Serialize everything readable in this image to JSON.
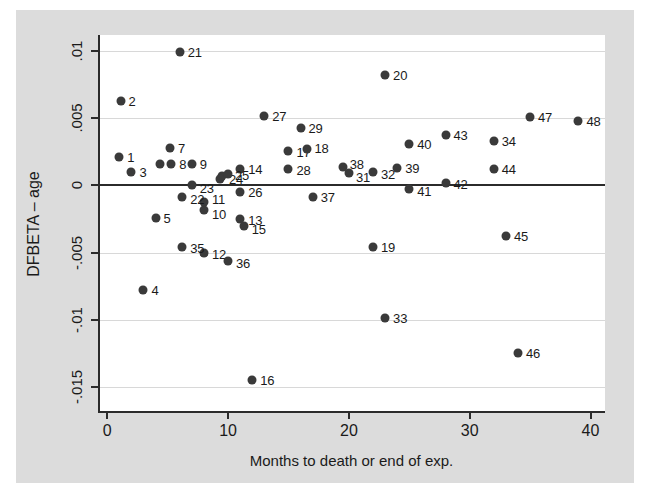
{
  "figure": {
    "background_color": "#dcdcdc",
    "plot_background_color": "#ffffff",
    "marker_color": "#3a3a3a",
    "axis_color": "#2b2b2b",
    "gridline_color": "#d8d8d8"
  },
  "chart_data": {
    "type": "scatter",
    "title": "",
    "xlabel": "Months to death or end of exp.",
    "ylabel": "DFBETA – age",
    "xlim": [
      -0.6,
      41.2
    ],
    "ylim": [
      -0.0168,
      0.0112
    ],
    "xticks": [
      0,
      10,
      20,
      30,
      40
    ],
    "xtick_labels": [
      "0",
      "10",
      "20",
      "30",
      "40"
    ],
    "yticks": [
      0.01,
      0.005,
      0,
      -0.005,
      -0.01,
      -0.015
    ],
    "ytick_labels": [
      ".01",
      ".005",
      "0",
      "-.005",
      "-.01",
      "-.015"
    ],
    "grid": true,
    "grid_axis": "y",
    "zero_reference_line": 0,
    "legend": null,
    "point_labels": true,
    "points": [
      {
        "label": "1",
        "x": 1.0,
        "y": 0.00215,
        "lx": 8,
        "ly": 0
      },
      {
        "label": "2",
        "x": 1.1,
        "y": 0.0063,
        "lx": 8,
        "ly": 0
      },
      {
        "label": "3",
        "x": 2.0,
        "y": 0.001,
        "lx": 8,
        "ly": 0
      },
      {
        "label": "4",
        "x": 3.0,
        "y": -0.0078,
        "lx": 8,
        "ly": 0
      },
      {
        "label": "5",
        "x": 4.0,
        "y": -0.0024,
        "lx": 8,
        "ly": 0
      },
      {
        "label": "6",
        "x": 4.4,
        "y": 0.0016,
        "lx": 8,
        "ly": 0,
        "hide_label": true
      },
      {
        "label": "7",
        "x": 5.2,
        "y": 0.00275,
        "lx": 8,
        "ly": 0
      },
      {
        "label": "8",
        "x": 5.3,
        "y": 0.0016,
        "lx": 8,
        "ly": 0
      },
      {
        "label": "9",
        "x": 7.0,
        "y": 0.0016,
        "lx": 8,
        "ly": 0
      },
      {
        "label": "10",
        "x": 8.0,
        "y": -0.00185,
        "lx": 8,
        "ly": 4
      },
      {
        "label": "11",
        "x": 8.0,
        "y": -0.00125,
        "lx": 8,
        "ly": -3
      },
      {
        "label": "12",
        "x": 8.0,
        "y": -0.005,
        "lx": 8,
        "ly": 1
      },
      {
        "label": "13",
        "x": 11.0,
        "y": -0.0025,
        "lx": 8,
        "ly": 1
      },
      {
        "label": "14",
        "x": 11.0,
        "y": 0.00125,
        "lx": 8,
        "ly": 0
      },
      {
        "label": "15",
        "x": 11.3,
        "y": -0.00305,
        "lx": 8,
        "ly": 3
      },
      {
        "label": "16",
        "x": 12.0,
        "y": -0.0145,
        "lx": 8,
        "ly": 0
      },
      {
        "label": "17",
        "x": 15.0,
        "y": 0.00255,
        "lx": 8,
        "ly": 1
      },
      {
        "label": "18",
        "x": 16.5,
        "y": 0.00268,
        "lx": 8,
        "ly": -1
      },
      {
        "label": "19",
        "x": 22.0,
        "y": -0.0046,
        "lx": 8,
        "ly": 0
      },
      {
        "label": "20",
        "x": 23.0,
        "y": 0.00825,
        "lx": 8,
        "ly": 0
      },
      {
        "label": "21",
        "x": 6.0,
        "y": 0.00995,
        "lx": 8,
        "ly": 0
      },
      {
        "label": "22",
        "x": 6.2,
        "y": -0.00085,
        "lx": 8,
        "ly": 2
      },
      {
        "label": "23",
        "x": 7.0,
        "y": 3e-05,
        "lx": 8,
        "ly": 3
      },
      {
        "label": "24",
        "x": 9.5,
        "y": 0.00068,
        "lx": 7,
        "ly": 3
      },
      {
        "label": "25",
        "x": 10.0,
        "y": 0.00085,
        "lx": 7,
        "ly": 1
      },
      {
        "label": "26",
        "x": 11.0,
        "y": -0.00048,
        "lx": 8,
        "ly": 0
      },
      {
        "label": "27",
        "x": 13.0,
        "y": 0.00515,
        "lx": 8,
        "ly": 0
      },
      {
        "label": "28",
        "x": 15.0,
        "y": 0.00125,
        "lx": 8,
        "ly": 1
      },
      {
        "label": "29",
        "x": 16.0,
        "y": 0.00425,
        "lx": 8,
        "ly": 0
      },
      {
        "label": "30",
        "x": 9.3,
        "y": 0.00045,
        "lx": 8,
        "ly": 0,
        "hide_label": true
      },
      {
        "label": "31",
        "x": 20.0,
        "y": 0.00095,
        "lx": 7,
        "ly": 4
      },
      {
        "label": "32",
        "x": 22.0,
        "y": 0.001,
        "lx": 8,
        "ly": 2
      },
      {
        "label": "33",
        "x": 23.0,
        "y": -0.0099,
        "lx": 8,
        "ly": 0
      },
      {
        "label": "34",
        "x": 32.0,
        "y": 0.0033,
        "lx": 8,
        "ly": 0
      },
      {
        "label": "35",
        "x": 6.2,
        "y": -0.0046,
        "lx": 8,
        "ly": 1
      },
      {
        "label": "36",
        "x": 10.0,
        "y": -0.0056,
        "lx": 8,
        "ly": 2
      },
      {
        "label": "37",
        "x": 17.0,
        "y": -0.0009,
        "lx": 8,
        "ly": 0
      },
      {
        "label": "38",
        "x": 19.5,
        "y": 0.00135,
        "lx": 7,
        "ly": -3
      },
      {
        "label": "39",
        "x": 24.0,
        "y": 0.0013,
        "lx": 8,
        "ly": 0
      },
      {
        "label": "40",
        "x": 25.0,
        "y": 0.00305,
        "lx": 8,
        "ly": 0
      },
      {
        "label": "41",
        "x": 25.0,
        "y": -0.00025,
        "lx": 8,
        "ly": 2
      },
      {
        "label": "42",
        "x": 28.0,
        "y": 0.0002,
        "lx": 8,
        "ly": 1
      },
      {
        "label": "43",
        "x": 28.0,
        "y": 0.00375,
        "lx": 8,
        "ly": 0
      },
      {
        "label": "44",
        "x": 32.0,
        "y": 0.00125,
        "lx": 8,
        "ly": 0
      },
      {
        "label": "45",
        "x": 33.0,
        "y": -0.00375,
        "lx": 8,
        "ly": 0
      },
      {
        "label": "46",
        "x": 34.0,
        "y": -0.0125,
        "lx": 8,
        "ly": 0
      },
      {
        "label": "47",
        "x": 35.0,
        "y": 0.0051,
        "lx": 8,
        "ly": 0
      },
      {
        "label": "48",
        "x": 39.0,
        "y": 0.0048,
        "lx": 8,
        "ly": 0
      }
    ]
  }
}
